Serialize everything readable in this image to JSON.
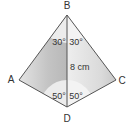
{
  "diagram": {
    "type": "kite-geometry",
    "vertices": [
      {
        "id": "B",
        "label": "B",
        "x": 67,
        "y": 15,
        "lx": 67,
        "ly": 9
      },
      {
        "id": "A",
        "label": "A",
        "x": 19,
        "y": 80,
        "lx": 11,
        "ly": 83
      },
      {
        "id": "C",
        "label": "C",
        "x": 116,
        "y": 80,
        "lx": 122,
        "ly": 84
      },
      {
        "id": "D",
        "label": "D",
        "x": 67,
        "y": 107,
        "lx": 67,
        "ly": 122
      }
    ],
    "segments": [
      {
        "from": "B",
        "to": "A"
      },
      {
        "from": "A",
        "to": "D"
      },
      {
        "from": "D",
        "to": "C"
      },
      {
        "from": "C",
        "to": "B"
      },
      {
        "from": "B",
        "to": "D"
      }
    ],
    "angles": [
      {
        "at": "B",
        "side": "left",
        "label": "30°"
      },
      {
        "at": "B",
        "side": "right",
        "label": "30°"
      },
      {
        "at": "D",
        "side": "left",
        "label": "50°"
      },
      {
        "at": "D",
        "side": "right",
        "label": "50°"
      }
    ],
    "length_label": "8 cm",
    "colors": {
      "stroke": "#555555",
      "fill_light": "#ececec",
      "fill_mid": "#d6d6d6",
      "fill_dark": "#bdbdbd",
      "text": "#333333"
    }
  }
}
